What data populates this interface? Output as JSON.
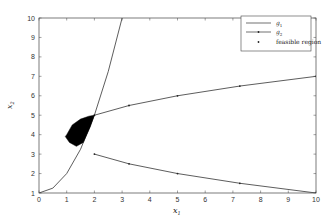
{
  "chart_data": {
    "type": "line",
    "title": "",
    "xlabel": "x1",
    "ylabel": "x2",
    "xlim": [
      0,
      10
    ],
    "ylim": [
      1,
      10
    ],
    "xticks": [
      0,
      1,
      2,
      3,
      4,
      5,
      6,
      7,
      8,
      9,
      10
    ],
    "yticks": [
      1,
      2,
      3,
      4,
      5,
      6,
      7,
      8,
      9,
      10
    ],
    "grid": false,
    "legend_position": "upper right",
    "series": [
      {
        "name": "g1",
        "style": "line",
        "x": [
          0,
          0.5,
          1,
          1.5,
          2,
          2.5,
          3,
          3.1623
        ],
        "y": [
          1,
          1.25,
          2,
          3.25,
          5,
          7.25,
          10,
          11
        ]
      },
      {
        "name": "g2",
        "style": "line-dot",
        "branches": [
          {
            "x": [
              2,
              3.25,
              5,
              7.25,
              10
            ],
            "y": [
              5,
              5.5,
              6,
              6.5,
              7
            ]
          },
          {
            "x": [
              2,
              3.25,
              5,
              7.25,
              10
            ],
            "y": [
              3,
              2.5,
              2,
              1.5,
              1
            ]
          }
        ]
      },
      {
        "name": "feasible region",
        "style": "filled-points",
        "polygon_x": [
          1.0,
          1.2,
          1.5,
          1.8,
          2.0,
          1.85,
          1.6,
          1.35,
          1.1,
          0.95,
          1.0
        ],
        "polygon_y": [
          4.0,
          4.5,
          4.8,
          4.95,
          5.0,
          4.4,
          3.6,
          3.4,
          3.6,
          3.9,
          4.0
        ]
      }
    ]
  },
  "legend": {
    "items": [
      {
        "label": "g1",
        "sub": "1"
      },
      {
        "label": "g2",
        "sub": "2"
      },
      {
        "label": "feasible region"
      }
    ]
  },
  "axes": {
    "xlabel_main": "x",
    "xlabel_sub": "1",
    "ylabel_main": "x",
    "ylabel_sub": "2"
  }
}
